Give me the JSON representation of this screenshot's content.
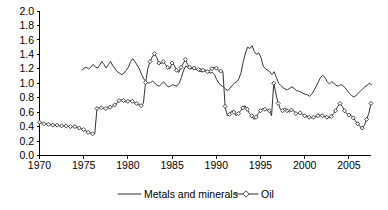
{
  "chart_data": {
    "type": "line",
    "title": "",
    "xlabel": "",
    "ylabel": "",
    "xlim": [
      1970,
      2007.5
    ],
    "ylim": [
      0.0,
      2.0
    ],
    "grid": false,
    "legend_position": "bottom",
    "x_ticks": [
      "1970",
      "1975",
      "1980",
      "1985",
      "1990",
      "1995",
      "2000",
      "2005"
    ],
    "x_tick_values": [
      1970,
      1975,
      1980,
      1985,
      1990,
      1995,
      2000,
      2005
    ],
    "y_ticks": [
      "0.0",
      "0.2",
      "0.4",
      "0.6",
      "0.8",
      "1.0",
      "1.2",
      "1.4",
      "1.6",
      "1.8",
      "2.0"
    ],
    "y_tick_values": [
      0.0,
      0.2,
      0.4,
      0.6,
      0.8,
      1.0,
      1.2,
      1.4,
      1.6,
      1.8,
      2.0
    ],
    "series": [
      {
        "name": "Metals and minerals",
        "marker": "none",
        "color": "#333333",
        "x_start": 1974.8,
        "x_step": 0.25,
        "values": [
          1.18,
          1.21,
          1.22,
          1.2,
          1.22,
          1.26,
          1.23,
          1.21,
          1.25,
          1.3,
          1.26,
          1.21,
          1.26,
          1.3,
          1.24,
          1.2,
          1.16,
          1.14,
          1.12,
          1.14,
          1.18,
          1.22,
          1.3,
          1.34,
          1.3,
          1.25,
          1.2,
          1.12,
          1.06,
          1.02,
          1.0,
          1.01,
          1.03,
          1.0,
          0.97,
          0.96,
          0.99,
          1.02,
          0.98,
          0.95,
          0.96,
          0.98,
          0.97,
          0.96,
          1.0,
          1.08,
          1.18,
          1.24,
          1.22,
          1.2,
          1.22,
          1.21,
          1.19,
          1.17,
          1.16,
          1.17,
          1.18,
          1.16,
          1.14,
          1.15,
          1.12,
          1.05,
          1.0,
          0.97,
          0.95,
          0.92,
          0.9,
          0.93,
          0.97,
          1.0,
          1.02,
          1.06,
          1.15,
          1.3,
          1.42,
          1.5,
          1.48,
          1.52,
          1.44,
          1.4,
          1.42,
          1.36,
          1.24,
          1.2,
          1.18,
          1.16,
          1.12,
          1.16,
          1.08,
          1.0,
          0.97,
          0.94,
          0.92,
          0.91,
          0.93,
          0.95,
          0.93,
          0.9,
          0.89,
          0.88,
          0.86,
          0.85,
          0.84,
          0.82,
          0.85,
          0.9,
          0.96,
          1.02,
          1.08,
          1.11,
          1.08,
          1.02,
          0.99,
          1.02,
          1.0,
          0.97,
          0.96,
          0.98,
          0.97,
          0.94,
          0.9,
          0.86,
          0.83,
          0.81,
          0.83,
          0.86,
          0.89,
          0.92,
          0.95,
          0.97,
          1.0,
          0.98,
          0.94,
          0.9,
          0.93,
          0.92,
          0.88,
          0.9,
          0.94,
          0.95,
          0.94,
          0.96,
          0.99,
          1.0,
          0.99,
          1.02,
          1.05,
          1.08,
          1.1,
          1.14,
          1.18,
          1.22,
          1.3,
          1.38,
          1.4
        ]
      },
      {
        "name": "Oil",
        "marker": "diamond",
        "color": "#333333",
        "x_start": 1970.0,
        "x_step": 0.25,
        "values": [
          0.46,
          0.45,
          0.44,
          0.44,
          0.43,
          0.43,
          0.42,
          0.42,
          0.42,
          0.41,
          0.41,
          0.41,
          0.41,
          0.4,
          0.4,
          0.4,
          0.4,
          0.39,
          0.38,
          0.37,
          0.36,
          0.34,
          0.32,
          0.31,
          0.3,
          0.3,
          0.65,
          0.66,
          0.66,
          0.65,
          0.65,
          0.66,
          0.67,
          0.68,
          0.7,
          0.72,
          0.76,
          0.77,
          0.76,
          0.74,
          0.75,
          0.76,
          0.75,
          0.73,
          0.72,
          0.7,
          0.69,
          0.72,
          1.01,
          1.2,
          1.3,
          1.36,
          1.41,
          1.36,
          1.28,
          1.27,
          1.3,
          1.26,
          1.22,
          1.2,
          1.28,
          1.25,
          1.18,
          1.15,
          1.22,
          1.27,
          1.33,
          1.26,
          1.22,
          1.2,
          1.21,
          1.19,
          1.19,
          1.2,
          1.18,
          1.17,
          1.16,
          1.18,
          1.2,
          1.22,
          1.21,
          1.18,
          1.17,
          1.16,
          0.68,
          0.55,
          0.57,
          0.62,
          0.6,
          0.55,
          0.58,
          0.62,
          0.66,
          0.69,
          0.64,
          0.58,
          0.55,
          0.5,
          0.53,
          0.58,
          0.62,
          0.65,
          0.64,
          0.63,
          0.62,
          0.55,
          1.0,
          0.85,
          0.72,
          0.64,
          0.62,
          0.66,
          0.62,
          0.6,
          0.63,
          0.62,
          0.58,
          0.58,
          0.59,
          0.57,
          0.55,
          0.54,
          0.53,
          0.52,
          0.53,
          0.54,
          0.55,
          0.56,
          0.55,
          0.54,
          0.53,
          0.52,
          0.54,
          0.58,
          0.62,
          0.68,
          0.72,
          0.68,
          0.62,
          0.58,
          0.56,
          0.55,
          0.52,
          0.48,
          0.44,
          0.4,
          0.38,
          0.42,
          0.5,
          0.58,
          0.72,
          0.86,
          0.92,
          0.96,
          1.0,
          1.02,
          1.06,
          1.0,
          0.92,
          0.86,
          0.78,
          0.72,
          0.8,
          0.84,
          0.86,
          0.88,
          0.92,
          0.95,
          0.94,
          0.98,
          1.02,
          1.08,
          1.14,
          1.18,
          1.26,
          1.34,
          1.4,
          1.48,
          1.75
        ]
      }
    ],
    "annotations": []
  },
  "legend": {
    "items": [
      {
        "label": "Metals and minerals",
        "marker": "none"
      },
      {
        "label": "Oil",
        "marker": "diamond"
      }
    ]
  },
  "colors": {
    "axis": "#000000",
    "metals_line": "#333333",
    "oil_line": "#333333",
    "background": "#ffffff"
  }
}
